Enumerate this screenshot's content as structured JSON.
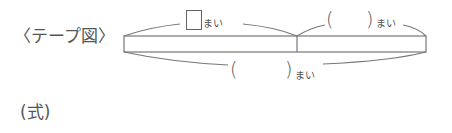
{
  "title_label": "〈テープ図〉",
  "tape": {
    "top_left_unit": "まい",
    "top_right_open": "(",
    "top_right_close": ")",
    "top_right_unit": "まい",
    "bottom_open": "(",
    "bottom_close": ")",
    "bottom_unit": "まい"
  },
  "formula_label": "(式)",
  "colors": {
    "line": "#666666",
    "text": "#555555"
  }
}
